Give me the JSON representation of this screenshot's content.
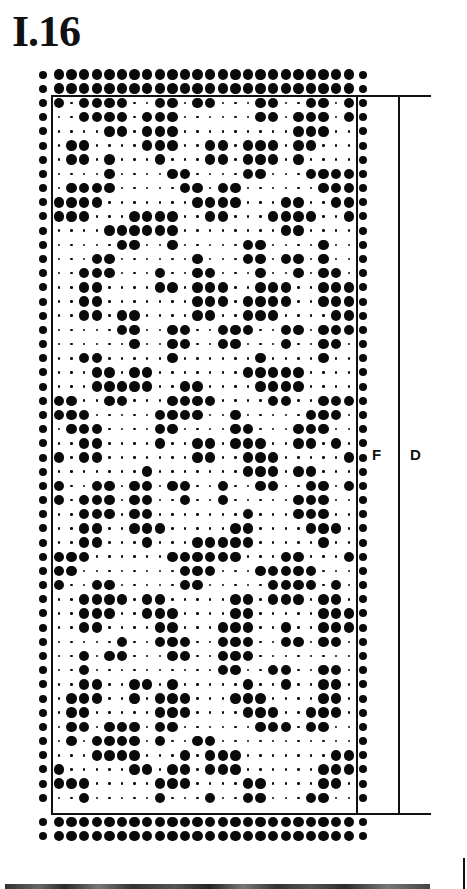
{
  "title": "I.16",
  "labels": {
    "f": "F",
    "d": "D"
  },
  "colors": {
    "ink": "#0a0a0a",
    "background": "#ffffff"
  },
  "grid": {
    "columns": 24,
    "rows": 50,
    "border_rows_top": 2,
    "border_rows_bottom": 2,
    "edge_columns": "left and right edge columns filled",
    "legend": {
      "1": "large dot (filled)",
      "0": "small dot (empty)"
    },
    "pattern": [
      "101111001101100011001101",
      "001111011100000011011101",
      "000011011100000000011100",
      "011000011100110111011000",
      "011010001000110111010000",
      "000010000110000110001111",
      "011110000011011000000111",
      "111100000001111000110011",
      "111000111100110001111001",
      "000011111100000000110000",
      "000001100100000110000100",
      "000110000001000110110100",
      "001110001001100010010110",
      "001100001101110011100111",
      "001100000001110111100111",
      "001101100001100111000011",
      "000001100110011100110111",
      "000000100110011000100110",
      "001100000100000010000100",
      "000110110000000111110000",
      "000111110011000011110000",
      "110011000111100001100111",
      "111000001111001000001110",
      "011100001100001100011100",
      "001100001001101110011010",
      "101100000001100111000001",
      "000000010000000111011000",
      "100110110110010011001101",
      "101110110010010000011100",
      "001110110000000100011100",
      "001100111000001100001110",
      "001100010001111100000100",
      "111000000111111000110001",
      "110000000011100011111000",
      "100110000011000001111010",
      "001111011000001101110110",
      "001110011100001100000111",
      "001100001100011100100111",
      "000001001110011100110110",
      "001011000110011100000000",
      "001000000000011001100110",
      "001100110100000100100110",
      "011100101110001110000110",
      "011000001110000111001110",
      "011011101100000011101100",
      "010111101001100000000000",
      "000111100010111000000011",
      "100000110110111000000111",
      "111000001110000110000110",
      "001000001000100110001100"
    ]
  }
}
